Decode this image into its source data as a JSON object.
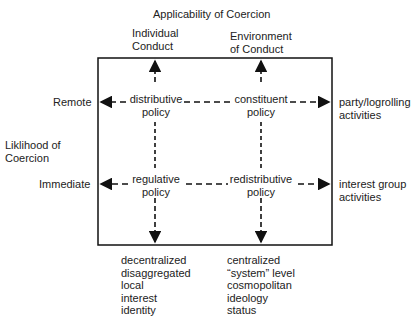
{
  "diagram": {
    "title": "Applicability of Coercion",
    "columns": [
      {
        "label_line1": "Individual",
        "label_line2": "Conduct"
      },
      {
        "label_line1": "Environment",
        "label_line2": "of Conduct"
      }
    ],
    "rows_axis": {
      "label_line1": "Liklihood of",
      "label_line2": "Coercion"
    },
    "rows": [
      {
        "label": "Remote"
      },
      {
        "label": "Immediate"
      }
    ],
    "cells": [
      {
        "line1": "distributive",
        "line2": "policy"
      },
      {
        "line1": "constituent",
        "line2": "policy"
      },
      {
        "line1": "regulative",
        "line2": "policy"
      },
      {
        "line1": "redistributive",
        "line2": "policy"
      }
    ],
    "right_outcomes": [
      {
        "line1": "party/logrolling",
        "line2": "activities"
      },
      {
        "line1": "interest group",
        "line2": "activities"
      }
    ],
    "bottom_outcomes": [
      {
        "lines": [
          "decentralized",
          "disaggregated",
          "local",
          "interest",
          "identity"
        ]
      },
      {
        "lines": [
          "centralized",
          "“system” level",
          "cosmopolitan",
          "ideology",
          "status"
        ]
      }
    ],
    "colors": {
      "line": "#111111",
      "text": "#222222"
    }
  }
}
